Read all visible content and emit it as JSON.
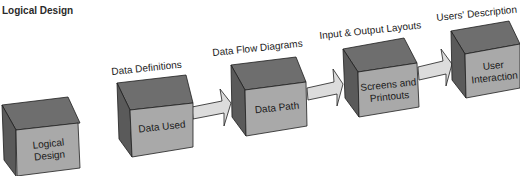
{
  "title": "Logical Design",
  "steps": [
    {
      "header": "",
      "box_label": "Logical Design"
    },
    {
      "header": "Data Definitions",
      "box_label": "Data Used"
    },
    {
      "header": "Data Flow Diagrams",
      "box_label": "Data Path"
    },
    {
      "header": "Input & Output Layouts",
      "box_label": "Screens and Printouts"
    },
    {
      "header": "Users' Description",
      "box_label": "User Interaction"
    }
  ],
  "colors": {
    "box_top": "#6e6e6e",
    "box_side": "#5a5a5a",
    "box_front": "#a9a9a9",
    "arrow_fill": "#dcdcdc",
    "outline": "#1e1e1e"
  }
}
